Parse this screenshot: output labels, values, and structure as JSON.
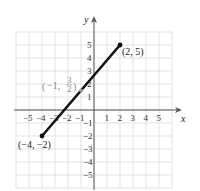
{
  "chart_data": {
    "type": "line",
    "title": "",
    "xlabel": "x",
    "ylabel": "y",
    "xlim": [
      -6,
      6
    ],
    "ylim": [
      -6,
      6
    ],
    "grid": true,
    "x_ticks": [
      "-5",
      "-4",
      "-3",
      "-2",
      "-1",
      "1",
      "2",
      "3",
      "4",
      "5"
    ],
    "y_ticks": [
      "5",
      "4",
      "3",
      "2",
      "1",
      "-1",
      "-2",
      "-3",
      "-4",
      "-5"
    ],
    "series": [
      {
        "name": "segment",
        "points": [
          [
            -4,
            -2
          ],
          [
            2,
            5
          ]
        ]
      }
    ],
    "annotations": [
      {
        "text": "(2, 5)",
        "x": 2,
        "y": 5
      },
      {
        "text": "(-4, -2)",
        "x": -4,
        "y": -2
      },
      {
        "text": "(-1, 3/2)",
        "x": -1,
        "y": 1.5,
        "note": "midpoint"
      }
    ]
  },
  "labels": {
    "x_axis": "x",
    "y_axis": "y",
    "end_point": "(2, 5)",
    "start_point": "(−4, −2)",
    "midpoint_prefix": "−1,",
    "midpoint_num": "3",
    "midpoint_den": "2"
  }
}
